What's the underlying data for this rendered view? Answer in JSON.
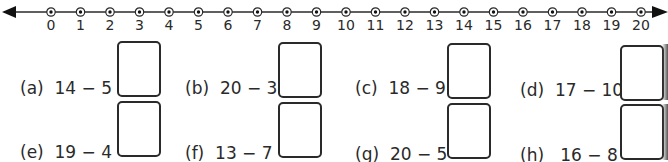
{
  "number_line": {
    "start": 0,
    "end": 20,
    "labels": [
      "0",
      "1",
      "2",
      "3",
      "4",
      "5",
      "6",
      "7",
      "8",
      "9",
      "10",
      "11",
      "12",
      "13",
      "14",
      "15",
      "16",
      "17",
      "18",
      "19",
      "20"
    ],
    "arrows": "both",
    "marker": "dotted-circle"
  },
  "problems": [
    {
      "id": "a",
      "label": "(a)",
      "expression": "14 − 5 =",
      "answer": ""
    },
    {
      "id": "b",
      "label": "(b)",
      "expression": "20 − 3 =",
      "answer": ""
    },
    {
      "id": "c",
      "label": "(c)",
      "expression": "18 − 9 =",
      "answer": ""
    },
    {
      "id": "d",
      "label": "(d)",
      "expression": "17 − 10 =",
      "answer": ""
    },
    {
      "id": "e",
      "label": "(e)",
      "expression": "19 − 4 =",
      "answer": ""
    },
    {
      "id": "f",
      "label": "(f)",
      "expression": "13 − 7 =",
      "answer": ""
    },
    {
      "id": "g",
      "label": "(g)",
      "expression": "20 − 5 =",
      "answer": ""
    },
    {
      "id": "h",
      "label": "(h)",
      "expression": "16 − 8 =",
      "answer": ""
    }
  ],
  "colors": {
    "ink": "#2a2a2a",
    "background": "#ffffff"
  }
}
